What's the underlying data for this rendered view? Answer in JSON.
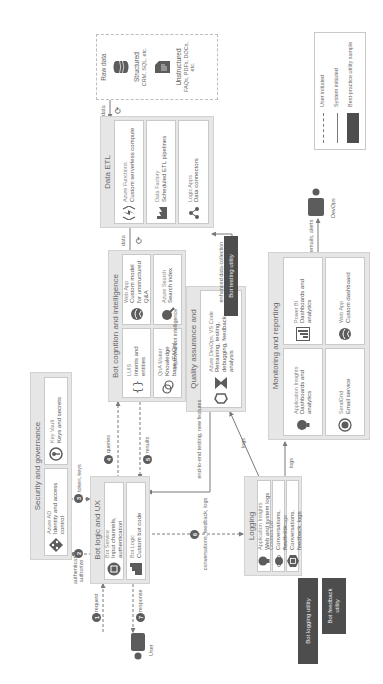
{
  "diagram": {
    "orientation": "rotated-90-ccw",
    "groups": {
      "security": {
        "title": "Security and governance",
        "services": [
          {
            "name": "Azure AD",
            "desc": "Identity and access control",
            "icon": "azure-ad-icon"
          },
          {
            "name": "Key Vault",
            "desc": "Keys and secrets",
            "icon": "key-vault-icon"
          }
        ]
      },
      "bot_logic": {
        "title": "Bot logic and UX",
        "services": [
          {
            "name": "Bot Service",
            "desc": "Input channels, authentication",
            "icon": "bot-service-icon"
          },
          {
            "name": "Bot Logic",
            "desc": "Custom bot code",
            "icon": "bot-logic-icon"
          }
        ]
      },
      "cognition": {
        "title": "Bot cognition and intelligence",
        "services": [
          {
            "name": "LUIS",
            "desc": "Intents and entities",
            "icon": "luis-icon"
          },
          {
            "name": "QnA Maker",
            "desc": "Knowledge base (FAQs)",
            "icon": "qna-maker-icon"
          },
          {
            "name": "Web App",
            "desc": "Custom model for unstructured Q&A",
            "icon": "web-app-icon"
          },
          {
            "name": "Azure Search",
            "desc": "Search index",
            "icon": "azure-search-icon"
          }
        ]
      },
      "etl": {
        "title": "Data ETL",
        "services": [
          {
            "name": "Azure Functions",
            "desc": "Custom serverless compute",
            "icon": "azure-functions-icon"
          },
          {
            "name": "Data Factory",
            "desc": "Scheduled ETL pipelines",
            "icon": "data-factory-icon"
          },
          {
            "name": "Logic Apps",
            "desc": "Data connectors",
            "icon": "logic-apps-icon"
          }
        ]
      },
      "raw_data": {
        "title": "Raw data",
        "items": [
          {
            "name": "Structured",
            "desc": "CRM, SQL, etc.",
            "icon": "database-icon"
          },
          {
            "name": "Unstructured",
            "desc": "FAQs, PDFs, DOCs, etc.",
            "icon": "document-icon"
          }
        ]
      },
      "qa": {
        "title": "Quality assurance and enhancements",
        "services": [
          {
            "name": "Azure DevOps, VS Code",
            "desc": "Retraining, testing, debugging, feedback analysis",
            "icon": "devops-icon"
          }
        ]
      },
      "logging": {
        "title": "Logging",
        "services": [
          {
            "name": "Application Insights",
            "desc": "Web and system logs",
            "icon": "app-insights-icon"
          },
          {
            "name": "Cosmos DB",
            "desc": "Conversations, feedback",
            "icon": "cosmos-db-icon"
          },
          {
            "name": "Azure Storage",
            "desc": "Conversations, feedback, logs",
            "icon": "azure-storage-icon"
          }
        ]
      },
      "monitoring": {
        "title": "Monitoring and reporting",
        "services": [
          {
            "name": "Application Insights",
            "desc": "Dashboards and analytics",
            "icon": "app-insights-icon"
          },
          {
            "name": "SendGrid",
            "desc": "Email service",
            "icon": "sendgrid-icon"
          },
          {
            "name": "Power BI",
            "desc": "Dashboards and analytics",
            "icon": "power-bi-icon"
          },
          {
            "name": "Web App",
            "desc": "Custom dashboard",
            "icon": "web-app-icon"
          }
        ]
      }
    },
    "utilities": {
      "testing": "Bot testing utility",
      "logging": "Bot logging utility",
      "feedback": "Bot feedback utility"
    },
    "actors": {
      "user": "User",
      "devops": "DevOps"
    },
    "flows": {
      "request": {
        "step": "1",
        "label": "request"
      },
      "authenticate": {
        "step": "2",
        "label": "authenticate, authorize"
      },
      "tokens": {
        "step": "3",
        "label": "token, keys"
      },
      "queries": {
        "step": "4",
        "label": "queries"
      },
      "results": {
        "step": "5",
        "label": "results"
      },
      "conversations": {
        "step": "6",
        "label": "conversations, feedback, logs"
      },
      "response": {
        "step": "7",
        "label": "response"
      },
      "data_to_etl": "data",
      "data_to_cognition": "data",
      "enhanced": "enhanced data collection",
      "improved": "improved bot intelligence",
      "e2e": "end-to-end testing, new features",
      "logs_qa": "logs",
      "logs_monitoring": "logs",
      "emails": "emails, alerts"
    },
    "legend": {
      "items": [
        {
          "style": "dashed",
          "label": "User initiated"
        },
        {
          "style": "solid",
          "label": "System initiated"
        },
        {
          "style": "fill",
          "label": "Best-practice utility sample"
        }
      ]
    },
    "colors": {
      "group_bg": "#e6e6e6",
      "card_bg": "#ffffff",
      "utility_bg": "#4d4d4d",
      "icon": "#5c5c5c",
      "line": "#7a7a7a"
    }
  }
}
